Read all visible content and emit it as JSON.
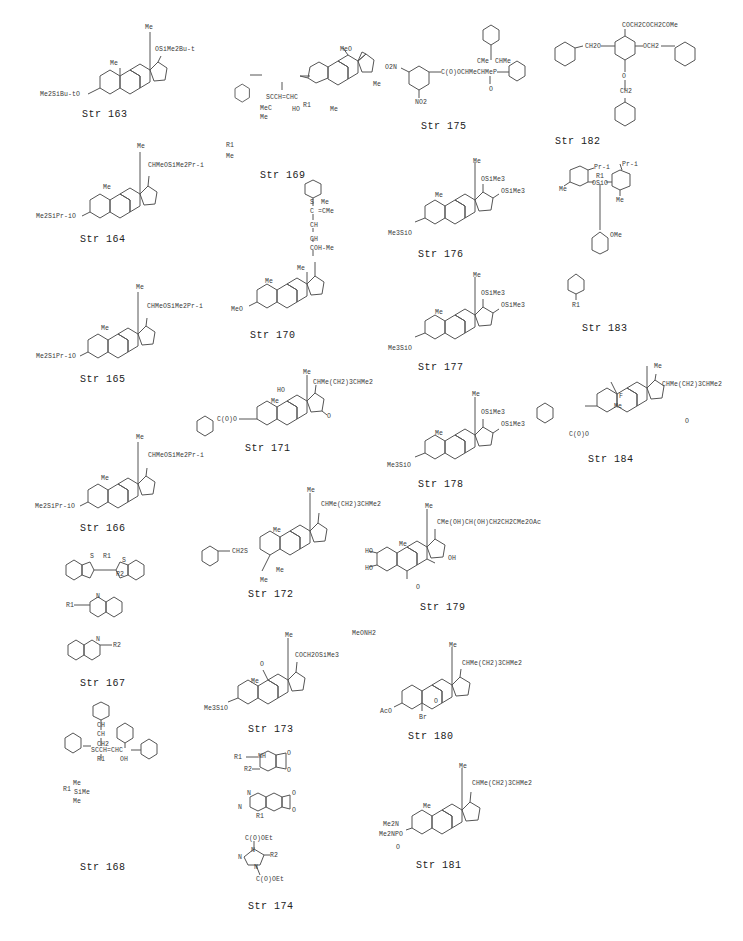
{
  "document": {
    "type": "chemical structure index page",
    "structures": [
      {
        "id": "163",
        "caption": "Str  163",
        "labels": {
          "top": "Me",
          "side": "OSiMe2Bu-t",
          "ring_me": "Me",
          "left": "Me2SiBu-tO"
        }
      },
      {
        "id": "164",
        "caption": "Str  164",
        "labels": {
          "top": "Me",
          "side": "CHMeOSiMe2Pr-i",
          "ring_me": "Me",
          "left": "Me2SiPr-iO"
        }
      },
      {
        "id": "165",
        "caption": "Str  165",
        "labels": {
          "top": "Me",
          "side": "CHMeOSiMe2Pr-i",
          "ring_me": "Me",
          "left": "Me2SiPr-iO"
        }
      },
      {
        "id": "166",
        "caption": "Str  166",
        "labels": {
          "top": "Me",
          "side": "CHMeOSiMe2Pr-i",
          "ring_me": "Me",
          "left": "Me2SiPr-iO"
        }
      },
      {
        "id": "167",
        "caption": "Str  167",
        "labels": {
          "s1": "S",
          "s2": "S",
          "r1": "R1",
          "r2": "R2",
          "q1_r": "R1",
          "q1_n": "N",
          "q2_n": "N",
          "q2_r": "R2"
        }
      },
      {
        "id": "168",
        "caption": "Str  168",
        "labels": {
          "ch1": "CH",
          "ch2": "CH",
          "ch2b": "CH2",
          "chain": "SCCH=CHC",
          "r1": "R1",
          "oh": "OH",
          "r1_def": "R1",
          "si": "Si",
          "me1": "Me",
          "me2": "Me",
          "me3": "Me"
        }
      },
      {
        "id": "169",
        "caption": "Str  169",
        "labels": {
          "meo": "MeO",
          "me_right": "Me",
          "me_bottom": "Me",
          "chain": "SCCH=CHC",
          "mec": "MeC",
          "me_low": "Me",
          "ho": "HO",
          "r1": "R1",
          "r1_def": "R1",
          "r1_def_me": "Me"
        }
      },
      {
        "id": "170",
        "caption": "Str  170",
        "labels": {
          "s": "S",
          "me_top": "Me",
          "c_eq": "C =CMe",
          "ch1": "CH",
          "ch2": "CH",
          "coh": "COH-Me",
          "me": "Me",
          "ring_me": "Me",
          "left": "MeO"
        }
      },
      {
        "id": "171",
        "caption": "Str  171",
        "labels": {
          "top": "Me",
          "side": "CHMe(CH2)3CHMe2",
          "ho": "HO",
          "ring_me": "Me",
          "oxo": "O",
          "ester": "C(O)O"
        }
      },
      {
        "id": "172",
        "caption": "Str  172",
        "labels": {
          "top": "Me",
          "side": "CHMe(CH2)3CHMe2",
          "ring_me": "Me",
          "ch2s": "CH2S",
          "me4a": "Me",
          "me4b": "Me"
        }
      },
      {
        "id": "173",
        "caption": "Str  173",
        "labels": {
          "top": "Me",
          "side": "COCH2OSiMe3",
          "oxo": "O",
          "ring_me": "Me",
          "left": "Me3SiO",
          "reagent": "MeONH2"
        }
      },
      {
        "id": "174",
        "caption": "Str  174",
        "labels": {
          "r1": "R1",
          "nh": "NH",
          "r2": "R2",
          "o1": "O",
          "o2": "O",
          "n1": "N",
          "n2": "N",
          "r1b": "R1",
          "o3": "O",
          "o4": "O",
          "ester1": "C(O)OEt",
          "n3": "N",
          "n4": "N",
          "n5": "N",
          "r2b": "R2",
          "ester2": "C(O)OEt"
        }
      },
      {
        "id": "175",
        "caption": "Str  175",
        "labels": {
          "no2_top": "O2N",
          "no2_bottom": "NO2",
          "chain": "C(O)OCHMeCHMeP",
          "cme": "CMe",
          "chme": "CHMe",
          "po": "O"
        }
      },
      {
        "id": "176",
        "caption": "Str  176",
        "labels": {
          "top": "Me",
          "o17": "OSiMe3",
          "o16": "OSiMe3",
          "ring_me": "Me",
          "left": "Me3SiO"
        }
      },
      {
        "id": "177",
        "caption": "Str  177",
        "labels": {
          "top": "Me",
          "o17": "OSiMe3",
          "o16": "OSiMe3",
          "ring_me": "Me",
          "left": "Me3SiO"
        }
      },
      {
        "id": "178",
        "caption": "Str  178",
        "labels": {
          "top": "Me",
          "o17": "OSiMe3",
          "o16": "OSiMe3",
          "ring_me": "Me",
          "left": "Me3SiO"
        }
      },
      {
        "id": "179",
        "caption": "Str  179",
        "labels": {
          "top": "Me",
          "side": "CMe(OH)CH(OH)CH2CH2CMe2OAc",
          "ho1": "HO",
          "ho2": "HO",
          "ring_me": "Me",
          "oh": "OH",
          "oxo": "O"
        }
      },
      {
        "id": "180",
        "caption": "Str  180",
        "labels": {
          "top": "Me",
          "side": "CHMe(CH2)3CHMe2",
          "aco": "AcO",
          "br": "Br",
          "epox": "O"
        }
      },
      {
        "id": "181",
        "caption": "Str  181",
        "labels": {
          "top": "Me",
          "side": "CHMe(CH2)3CHMe2",
          "ring_me": "Me",
          "me2n1": "Me2N",
          "me2n2": "Me2NPO",
          "po": "O"
        }
      },
      {
        "id": "182",
        "caption": "Str  182",
        "labels": {
          "top": "COCH2COCH2COMe",
          "left": "CH2O",
          "right": "OCH2",
          "o": "O",
          "ch2": "CH2"
        }
      },
      {
        "id": "183",
        "caption": "Str  183",
        "labels": {
          "pr1": "Pr-i",
          "r1": "R1",
          "osio": "OSiO",
          "pr2": "Pr-i",
          "me_left": "Me",
          "me_right": "Me",
          "ome": "OMe",
          "r1_def": "R1"
        }
      },
      {
        "id": "184",
        "caption": "Str  184",
        "labels": {
          "top": "Me",
          "side": "CHMe(CH2)3CHMe2",
          "f": "F",
          "ring_me": "Me",
          "oxo": "O",
          "ester": "C(O)O"
        }
      }
    ]
  }
}
